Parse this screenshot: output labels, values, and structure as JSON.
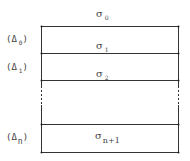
{
  "diagram": {
    "type": "layered-medium",
    "layers": [
      {
        "sigma_label": "σ",
        "sigma_sub": "0",
        "thickness_label": null
      },
      {
        "sigma_label": "σ",
        "sigma_sub": "1",
        "thickness_label": "(Δ",
        "thickness_sub": "0",
        "thickness_close": ")"
      },
      {
        "sigma_label": "σ",
        "sigma_sub": "2",
        "thickness_label": "(Δ",
        "thickness_sub": "1",
        "thickness_close": ")"
      },
      {
        "sigma_label": "σ",
        "sigma_sub": "n+1",
        "thickness_label": "(Δ",
        "thickness_sub": "n",
        "thickness_close": ")"
      }
    ],
    "ellipsis": "⋮",
    "line_color": "#333333"
  }
}
